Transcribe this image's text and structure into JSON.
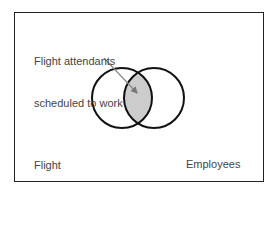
{
  "diagram": {
    "type": "venn",
    "intersection_label": [
      "Flight attendants",
      "scheduled to work"
    ],
    "left_set_label": [
      "Flight",
      "attendants"
    ],
    "right_set_label": [
      "Employees",
      "scheduled",
      "to work"
    ],
    "colors": {
      "border": "#222222",
      "circle_stroke": "#111111",
      "intersection_fill": "#cccccc",
      "arrow": "#888888",
      "text": "#444444"
    }
  }
}
